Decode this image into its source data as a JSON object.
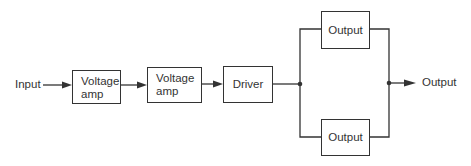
{
  "diagram": {
    "type": "block-diagram",
    "input_label": "Input",
    "output_label": "Output",
    "blocks": [
      {
        "id": "vamp1",
        "line1": "Voltage",
        "line2": "amp"
      },
      {
        "id": "vamp2",
        "line1": "Voltage",
        "line2": "amp"
      },
      {
        "id": "driver",
        "label": "Driver"
      },
      {
        "id": "output_top",
        "label": "Output"
      },
      {
        "id": "output_bottom",
        "label": "Output"
      }
    ],
    "connections": [
      [
        "Input",
        "vamp1"
      ],
      [
        "vamp1",
        "vamp2"
      ],
      [
        "vamp2",
        "driver"
      ],
      [
        "driver",
        "output_top"
      ],
      [
        "driver",
        "output_bottom"
      ],
      [
        "output_top",
        "Output"
      ],
      [
        "output_bottom",
        "Output"
      ]
    ],
    "colors": {
      "stroke": "#333333",
      "background": "#ffffff"
    }
  }
}
